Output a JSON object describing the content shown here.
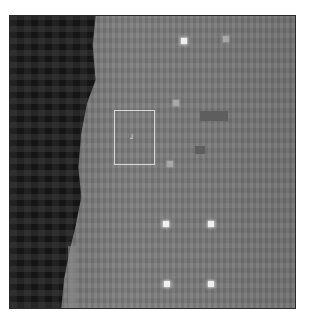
{
  "image": {
    "description": "Grayscale pixelated image with dark textured region on the left and lighter gray field on the right",
    "frame": {
      "left": 9,
      "top": 15,
      "width": 287,
      "height": 294,
      "border_color": "#2a2a2a"
    },
    "colors": {
      "dark_region": "#151515",
      "light_region": "#777777",
      "bright_spot": "#f0f0f0",
      "roi_box": "#d8d8d8"
    }
  },
  "roi": {
    "left": 104,
    "top": 94,
    "width": 41,
    "height": 55,
    "marker_label": "ɹ"
  },
  "bright_spots": [
    {
      "x": 171,
      "y": 22,
      "level": "bright"
    },
    {
      "x": 213,
      "y": 20,
      "level": "dim"
    },
    {
      "x": 163,
      "y": 84,
      "level": "dim"
    },
    {
      "x": 157,
      "y": 145,
      "level": "dim"
    },
    {
      "x": 153,
      "y": 205,
      "level": "bright"
    },
    {
      "x": 198,
      "y": 205,
      "level": "bright"
    },
    {
      "x": 154,
      "y": 265,
      "level": "bright"
    },
    {
      "x": 198,
      "y": 265,
      "level": "bright"
    }
  ]
}
